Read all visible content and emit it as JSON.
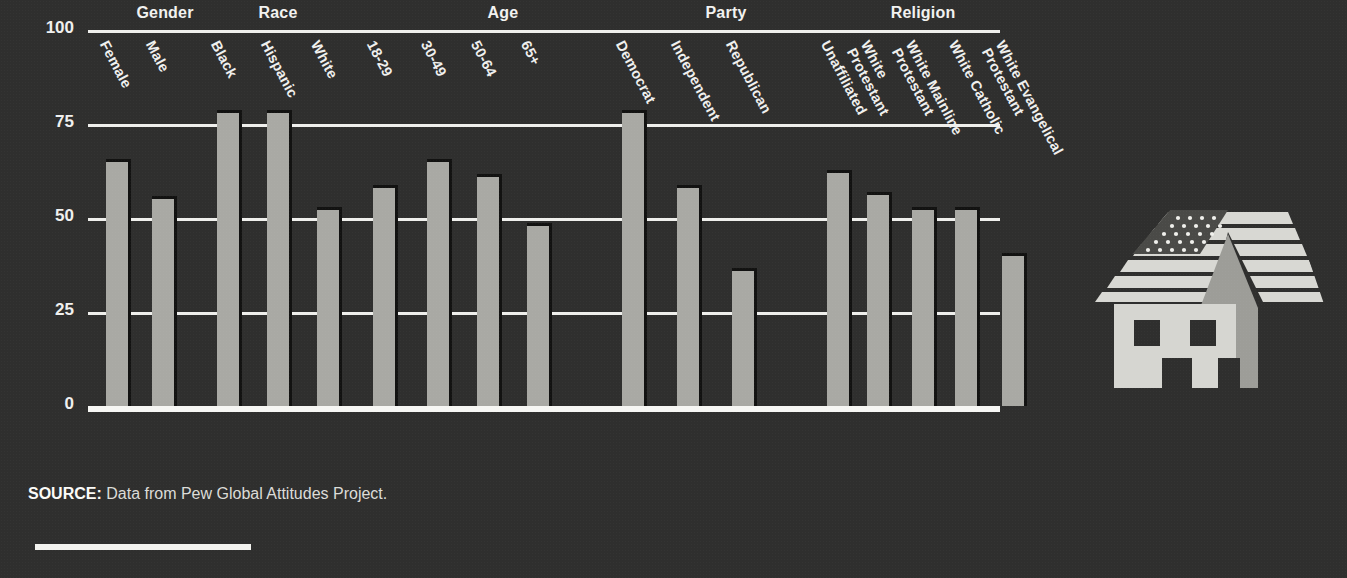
{
  "chart_data": {
    "type": "bar",
    "title": "",
    "xlabel": "",
    "ylabel": "",
    "ylim": [
      0,
      100
    ],
    "yticks": [
      0,
      25,
      50,
      75,
      100
    ],
    "grid": true,
    "legend": "none",
    "groups": [
      {
        "name": "Gender",
        "categories": [
          "Female",
          "Male"
        ],
        "values": [
          65,
          55
        ]
      },
      {
        "name": "Race",
        "categories": [
          "Black",
          "Hispanic",
          "White"
        ],
        "values": [
          78,
          78,
          52
        ]
      },
      {
        "name": "Age",
        "categories": [
          "18-29",
          "30-49",
          "50-64",
          "65+"
        ],
        "values": [
          58,
          65,
          61,
          48
        ]
      },
      {
        "name": "Party",
        "categories": [
          "Democrat",
          "Independent",
          "Republican"
        ],
        "values": [
          78,
          58,
          36
        ]
      },
      {
        "name": "Religion",
        "categories": [
          "Unaffiliated",
          "White Protestant",
          "White Mainline Protestant",
          "White Catholic",
          "White Evangelical Protestant"
        ],
        "values": [
          62,
          56,
          52,
          52,
          40
        ]
      }
    ],
    "categories": [
      "Female",
      "Male",
      "Black",
      "Hispanic",
      "White",
      "18-29",
      "30-49",
      "50-64",
      "65+",
      "Democrat",
      "Independent",
      "Republican",
      "Unaffiliated",
      "White Protestant",
      "White Mainline Protestant",
      "White Catholic",
      "White Evangelical Protestant"
    ],
    "values": [
      65,
      55,
      78,
      78,
      52,
      58,
      65,
      61,
      48,
      78,
      58,
      36,
      62,
      56,
      52,
      52,
      40
    ]
  },
  "axis": {
    "ytick_labels": [
      "100",
      "75",
      "50",
      "25",
      "0"
    ]
  },
  "group_headers": [
    "Gender",
    "Race",
    "Age",
    "Party",
    "Religion"
  ],
  "xtick_labels": [
    "Female",
    "Male",
    "Black",
    "Hispanic",
    "White",
    "18-29",
    "30-49",
    "50-64",
    "65+",
    "Democrat",
    "Independent",
    "Republican",
    "Unaffiliated",
    "White Protestant",
    "White Mainline Protestant",
    "White Catholic",
    "White Evangelical Protestant"
  ],
  "source": {
    "prefix": "SOURCE:",
    "text": " Data from Pew Global Attitudes Project."
  },
  "illustration": {
    "name": "flag-roof-house",
    "description": "House with American flag roof and steeple"
  },
  "colors": {
    "background": "#2f2f2e",
    "bar": "#a9a9a4",
    "gridline": "#efefec",
    "text": "#f0f0ee",
    "shadow": "#121211"
  }
}
